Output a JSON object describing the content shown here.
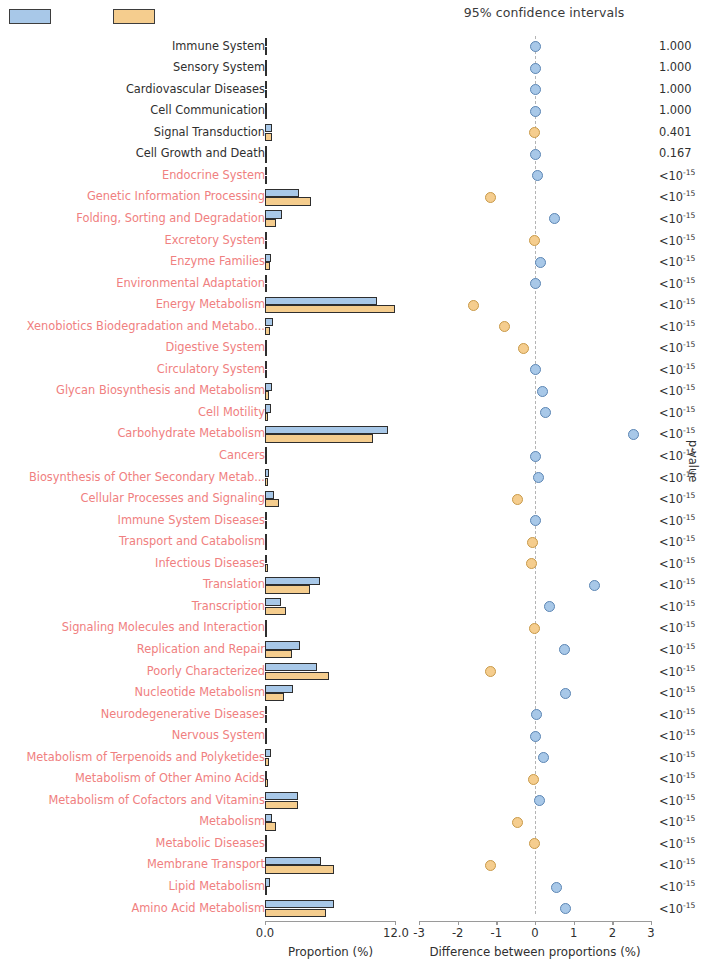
{
  "legend": {
    "group1_color": "#a8c8e8",
    "group2_color": "#f5cd8e",
    "group1_label": "",
    "group2_label": ""
  },
  "titles": {
    "ci_title": "95% confidence intervals",
    "left_axis_title": "Proportion (%)",
    "right_axis_title": "Difference between proportions (%)",
    "pvalue_axis_title": "p-value"
  },
  "axes": {
    "proportion": {
      "min": 0.0,
      "max": 12.0,
      "ticks": [
        "0.0",
        "12.0"
      ]
    },
    "difference": {
      "min": -3,
      "max": 3,
      "ticks": [
        "-3",
        "-2",
        "-1",
        "0",
        "1",
        "2",
        "3"
      ]
    }
  },
  "colors": {
    "significant_label": "#f08080",
    "nonsignificant_label": "#2f2f2f",
    "zero_line": "#b4b4b4"
  },
  "chart_data": {
    "type": "bar",
    "title": "95% confidence intervals",
    "xlabel": "Proportion (%)",
    "ylabel": "",
    "xlim": [
      0.0,
      12.0
    ],
    "diff_xlabel": "Difference between proportions (%)",
    "diff_xlim": [
      -3,
      3
    ],
    "categories": [
      "Immune System",
      "Sensory System",
      "Cardiovascular Diseases",
      "Cell Communication",
      "Signal Transduction",
      "Cell Growth and Death",
      "Endocrine System",
      "Genetic Information Processing",
      "Folding, Sorting and Degradation",
      "Excretory System",
      "Enzyme Families",
      "Environmental Adaptation",
      "Energy Metabolism",
      "Xenobiotics Biodegradation and Metabo...",
      "Digestive System",
      "Circulatory System",
      "Glycan Biosynthesis and Metabolism",
      "Cell Motility",
      "Carbohydrate Metabolism",
      "Cancers",
      "Biosynthesis of Other Secondary Metab...",
      "Cellular Processes and Signaling",
      "Immune System Diseases",
      "Transport and Catabolism",
      "Infectious Diseases",
      "Translation",
      "Transcription",
      "Signaling Molecules and Interaction",
      "Replication and Repair",
      "Poorly Characterized",
      "Nucleotide Metabolism",
      "Neurodegenerative Diseases",
      "Nervous System",
      "Metabolism of Terpenoids and Polyketides",
      "Metabolism of Other Amino Acids",
      "Metabolism of Cofactors and Vitamins",
      "Metabolism",
      "Metabolic Diseases",
      "Membrane Transport",
      "Lipid Metabolism",
      "Amino Acid Metabolism"
    ],
    "series": [
      {
        "name": "group1",
        "color": "#a8c8e8",
        "values": [
          0.02,
          0.02,
          0.02,
          0.03,
          0.62,
          0.22,
          0.1,
          3.1,
          1.55,
          0.03,
          0.57,
          0.05,
          10.3,
          0.72,
          0.1,
          0.03,
          0.6,
          0.55,
          11.3,
          0.04,
          0.35,
          0.82,
          0.03,
          0.17,
          0.22,
          5.05,
          1.5,
          0.06,
          3.2,
          4.75,
          2.55,
          0.12,
          0.04,
          0.54,
          0.22,
          3.05,
          0.6,
          0.03,
          5.15,
          0.47,
          6.35
        ]
      },
      {
        "name": "group2",
        "color": "#f5cd8e",
        "values": [
          0.02,
          0.02,
          0.02,
          0.03,
          0.62,
          0.11,
          0.04,
          4.25,
          1.05,
          0.03,
          0.42,
          0.05,
          11.9,
          0.45,
          0.18,
          0.03,
          0.4,
          0.28,
          9.85,
          0.04,
          0.27,
          1.27,
          0.03,
          0.1,
          0.3,
          4.1,
          1.88,
          0.06,
          2.45,
          5.9,
          1.75,
          0.08,
          0.04,
          0.38,
          0.3,
          3.05,
          1.05,
          0.03,
          6.3,
          0.22,
          5.55
        ]
      }
    ],
    "differences": [
      {
        "category": "Immune System",
        "diff": 0.0,
        "ci_low": -0.02,
        "ci_high": 0.02,
        "dot_color": "#a8c8e8",
        "pvalue": "1.000"
      },
      {
        "category": "Sensory System",
        "diff": 0.0,
        "ci_low": -0.02,
        "ci_high": 0.02,
        "dot_color": "#a8c8e8",
        "pvalue": "1.000"
      },
      {
        "category": "Cardiovascular Diseases",
        "diff": 0.0,
        "ci_low": -0.02,
        "ci_high": 0.02,
        "dot_color": "#a8c8e8",
        "pvalue": "1.000"
      },
      {
        "category": "Cell Communication",
        "diff": 0.0,
        "ci_low": -0.02,
        "ci_high": 0.02,
        "dot_color": "#a8c8e8",
        "pvalue": "1.000"
      },
      {
        "category": "Signal Transduction",
        "diff": -0.02,
        "ci_low": -0.06,
        "ci_high": 0.02,
        "dot_color": "#f5cd8e",
        "pvalue": "0.401"
      },
      {
        "category": "Cell Growth and Death",
        "diff": 0.02,
        "ci_low": -0.02,
        "ci_high": 0.06,
        "dot_color": "#a8c8e8",
        "pvalue": "0.167"
      },
      {
        "category": "Endocrine System",
        "diff": 0.06,
        "ci_low": 0.03,
        "ci_high": 0.09,
        "dot_color": "#a8c8e8",
        "pvalue": "<10e-15"
      },
      {
        "category": "Genetic Information Processing",
        "diff": -1.15,
        "ci_low": -1.22,
        "ci_high": -1.08,
        "dot_color": "#f5cd8e",
        "pvalue": "<10e-15"
      },
      {
        "category": "Folding, Sorting and Degradation",
        "diff": 0.5,
        "ci_low": 0.45,
        "ci_high": 0.55,
        "dot_color": "#a8c8e8",
        "pvalue": "<10e-15"
      },
      {
        "category": "Excretory System",
        "diff": -0.02,
        "ci_low": -0.04,
        "ci_high": 0.0,
        "dot_color": "#f5cd8e",
        "pvalue": "<10e-15"
      },
      {
        "category": "Enzyme Families",
        "diff": 0.15,
        "ci_low": 0.11,
        "ci_high": 0.19,
        "dot_color": "#a8c8e8",
        "pvalue": "<10e-15"
      },
      {
        "category": "Environmental Adaptation",
        "diff": 0.0,
        "ci_low": -0.02,
        "ci_high": 0.02,
        "dot_color": "#a8c8e8",
        "pvalue": "<10e-15"
      },
      {
        "category": "Energy Metabolism",
        "diff": -1.6,
        "ci_low": -1.7,
        "ci_high": -1.5,
        "dot_color": "#f5cd8e",
        "pvalue": "<10e-15"
      },
      {
        "category": "Xenobiotics Biodegradation and Metabo...",
        "diff": -0.8,
        "ci_low": -0.86,
        "ci_high": -0.74,
        "dot_color": "#f5cd8e",
        "pvalue": "<10e-15"
      },
      {
        "category": "Digestive System",
        "diff": -0.3,
        "ci_low": -0.34,
        "ci_high": -0.26,
        "dot_color": "#f5cd8e",
        "pvalue": "<10e-15"
      },
      {
        "category": "Circulatory System",
        "diff": 0.0,
        "ci_low": -0.02,
        "ci_high": 0.02,
        "dot_color": "#a8c8e8",
        "pvalue": "<10e-15"
      },
      {
        "category": "Glycan Biosynthesis and Metabolism",
        "diff": 0.2,
        "ci_low": 0.16,
        "ci_high": 0.24,
        "dot_color": "#a8c8e8",
        "pvalue": "<10e-15"
      },
      {
        "category": "Cell Motility",
        "diff": 0.27,
        "ci_low": 0.23,
        "ci_high": 0.31,
        "dot_color": "#a8c8e8",
        "pvalue": "<10e-15"
      },
      {
        "category": "Carbohydrate Metabolism",
        "diff": 2.55,
        "ci_low": 2.45,
        "ci_high": 2.65,
        "dot_color": "#a8c8e8",
        "pvalue": "<10e-15"
      },
      {
        "category": "Cancers",
        "diff": 0.0,
        "ci_low": -0.02,
        "ci_high": 0.02,
        "dot_color": "#a8c8e8",
        "pvalue": "<10e-15"
      },
      {
        "category": "Biosynthesis of Other Secondary Metab...",
        "diff": 0.08,
        "ci_low": 0.04,
        "ci_high": 0.12,
        "dot_color": "#a8c8e8",
        "pvalue": "<10e-15"
      },
      {
        "category": "Cellular Processes and Signaling",
        "diff": -0.45,
        "ci_low": -0.51,
        "ci_high": -0.39,
        "dot_color": "#f5cd8e",
        "pvalue": "<10e-15"
      },
      {
        "category": "Immune System Diseases",
        "diff": 0.0,
        "ci_low": -0.02,
        "ci_high": 0.02,
        "dot_color": "#a8c8e8",
        "pvalue": "<10e-15"
      },
      {
        "category": "Transport and Catabolism",
        "diff": -0.07,
        "ci_low": -0.1,
        "ci_high": -0.04,
        "dot_color": "#f5cd8e",
        "pvalue": "<10e-15"
      },
      {
        "category": "Infectious Diseases",
        "diff": -0.08,
        "ci_low": -0.11,
        "ci_high": -0.05,
        "dot_color": "#f5cd8e",
        "pvalue": "<10e-15"
      },
      {
        "category": "Translation",
        "diff": 1.55,
        "ci_low": 1.45,
        "ci_high": 1.65,
        "dot_color": "#a8c8e8",
        "pvalue": "<10e-15"
      },
      {
        "category": "Transcription",
        "diff": 0.38,
        "ci_low": 0.32,
        "ci_high": 0.44,
        "dot_color": "#a8c8e8",
        "pvalue": "<10e-15"
      },
      {
        "category": "Signaling Molecules and Interaction",
        "diff": -0.02,
        "ci_low": -0.04,
        "ci_high": 0.0,
        "dot_color": "#f5cd8e",
        "pvalue": "<10e-15"
      },
      {
        "category": "Replication and Repair",
        "diff": 0.75,
        "ci_low": 0.68,
        "ci_high": 0.82,
        "dot_color": "#a8c8e8",
        "pvalue": "<10e-15"
      },
      {
        "category": "Poorly Characterized",
        "diff": -1.15,
        "ci_low": -1.25,
        "ci_high": -1.05,
        "dot_color": "#f5cd8e",
        "pvalue": "<10e-15"
      },
      {
        "category": "Nucleotide Metabolism",
        "diff": 0.78,
        "ci_low": 0.71,
        "ci_high": 0.85,
        "dot_color": "#a8c8e8",
        "pvalue": "<10e-15"
      },
      {
        "category": "Neurodegenerative Diseases",
        "diff": 0.05,
        "ci_low": 0.02,
        "ci_high": 0.08,
        "dot_color": "#a8c8e8",
        "pvalue": "<10e-15"
      },
      {
        "category": "Nervous System",
        "diff": 0.02,
        "ci_low": 0.0,
        "ci_high": 0.04,
        "dot_color": "#a8c8e8",
        "pvalue": "<10e-15"
      },
      {
        "category": "Metabolism of Terpenoids and Polyketides",
        "diff": 0.22,
        "ci_low": 0.18,
        "ci_high": 0.26,
        "dot_color": "#a8c8e8",
        "pvalue": "<10e-15"
      },
      {
        "category": "Metabolism of Other Amino Acids",
        "diff": -0.05,
        "ci_low": -0.08,
        "ci_high": -0.02,
        "dot_color": "#f5cd8e",
        "pvalue": "<10e-15"
      },
      {
        "category": "Metabolism of Cofactors and Vitamins",
        "diff": 0.12,
        "ci_low": 0.08,
        "ci_high": 0.16,
        "dot_color": "#a8c8e8",
        "pvalue": "<10e-15"
      },
      {
        "category": "Metabolism",
        "diff": -0.45,
        "ci_low": -0.51,
        "ci_high": -0.39,
        "dot_color": "#f5cd8e",
        "pvalue": "<10e-15"
      },
      {
        "category": "Metabolic Diseases",
        "diff": -0.02,
        "ci_low": -0.04,
        "ci_high": 0.0,
        "dot_color": "#f5cd8e",
        "pvalue": "<10e-15"
      },
      {
        "category": "Membrane Transport",
        "diff": -1.15,
        "ci_low": -1.25,
        "ci_high": -1.05,
        "dot_color": "#f5cd8e",
        "pvalue": "<10e-15"
      },
      {
        "category": "Lipid Metabolism",
        "diff": 0.55,
        "ci_low": 0.49,
        "ci_high": 0.61,
        "dot_color": "#a8c8e8",
        "pvalue": "<10e-15"
      },
      {
        "category": "Amino Acid Metabolism",
        "diff": 0.8,
        "ci_low": 0.72,
        "ci_high": 0.88,
        "dot_color": "#a8c8e8",
        "pvalue": "<10e-15"
      }
    ],
    "pvalues_display": [
      "1.000",
      "1.000",
      "1.000",
      "1.000",
      "0.401",
      "0.167",
      "<10^-15",
      "<10^-15",
      "<10^-15",
      "<10^-15",
      "<10^-15",
      "<10^-15",
      "<10^-15",
      "<10^-15",
      "<10^-15",
      "<10^-15",
      "<10^-15",
      "<10^-15",
      "<10^-15",
      "<10^-15",
      "<10^-15",
      "<10^-15",
      "<10^-15",
      "<10^-15",
      "<10^-15",
      "<10^-15",
      "<10^-15",
      "<10^-15",
      "<10^-15",
      "<10^-15",
      "<10^-15",
      "<10^-15",
      "<10^-15",
      "<10^-15",
      "<10^-15",
      "<10^-15",
      "<10^-15",
      "<10^-15",
      "<10^-15",
      "<10^-15",
      "<10^-15"
    ],
    "significant_from_index": 6
  }
}
